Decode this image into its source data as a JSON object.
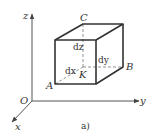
{
  "figure": {
    "caption": "a)",
    "axes": {
      "origin_label": "O",
      "x_label": "x",
      "y_label": "y",
      "z_label": "z"
    },
    "points": {
      "A": "A",
      "B": "B",
      "C": "C",
      "K": "K"
    },
    "dimensions": {
      "dx": "dx",
      "dy": "dy",
      "dz": "dz"
    },
    "colors": {
      "line": "#333333",
      "axis": "#555555",
      "dashed": "#777777"
    }
  }
}
